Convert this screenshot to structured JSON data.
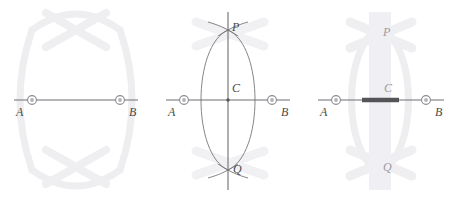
{
  "figure": {
    "panel_count": 3,
    "background_color": "#ffffff"
  },
  "colors": {
    "line": "#6e6e73",
    "arc": "#77777c",
    "label": "#4a4a4a",
    "ghost_arc": "#eeeef1",
    "ghost_label": "#b9b9bd",
    "highlight_band": "#f0eff4",
    "bold_segment": "#555558",
    "marker_ring": "#8a8a90",
    "marker_fill": "#c9c9ce"
  },
  "panels": [
    {
      "id": "panel-1",
      "name": "step-1-segment-ab",
      "labels": {
        "a": "A",
        "b": "B"
      },
      "elements": {
        "segment": "segment-ab",
        "ghost_arcs": "ghost-construction-arcs"
      }
    },
    {
      "id": "panel-2",
      "name": "step-2-arcs-and-bisector",
      "labels": {
        "a": "A",
        "b": "B",
        "c": "C",
        "p": "P",
        "q": "Q"
      },
      "elements": {
        "segment": "segment-ab",
        "arc_from_a": "arc-centered-at-a",
        "arc_from_b": "arc-centered-at-b",
        "bisector": "line-pq",
        "intersection_top": "point-p",
        "intersection_bottom": "point-q",
        "midpoint": "point-c"
      }
    },
    {
      "id": "panel-3",
      "name": "step-3-highlighted-bisector",
      "labels": {
        "a": "A",
        "b": "B",
        "c": "C",
        "p": "P",
        "q": "Q"
      },
      "elements": {
        "segment": "segment-ab",
        "highlight_band": "perpendicular-bisector-band",
        "bold_segment": "bisected-portion-of-ab",
        "ghost_arcs": "ghost-construction-arcs"
      }
    }
  ],
  "geometry": {
    "a_x": 32,
    "b_x": 120,
    "baseline_y": 100,
    "p_y": 30,
    "q_y": 170,
    "center_x": 76
  }
}
